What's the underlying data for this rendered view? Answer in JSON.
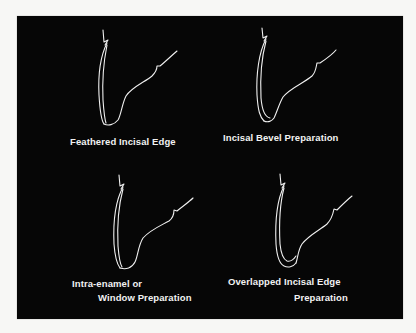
{
  "figure": {
    "background_color": "#f7f7f5",
    "panel_color": "#060606",
    "stroke_color": "#f0f0f0",
    "text_color": "#f2f2f2",
    "panels": [
      {
        "id": "top-left",
        "label_lines": [
          "Feathered Incisal Edge"
        ]
      },
      {
        "id": "top-right",
        "label_lines": [
          "Incisal Bevel Preparation"
        ]
      },
      {
        "id": "bottom-left",
        "label_lines": [
          "Intra-enamel or",
          "Window Preparation"
        ]
      },
      {
        "id": "bottom-right",
        "label_lines": [
          "Overlapped Incisal Edge",
          "Preparation"
        ]
      }
    ]
  }
}
